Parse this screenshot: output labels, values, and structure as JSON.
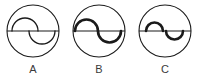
{
  "diagram": {
    "background_color": "#ffffff",
    "stroke_color": "#1a1a1a",
    "label_color": "#3b3b3b",
    "figures": [
      {
        "label": "A",
        "label_name": "figure-label-a",
        "outer_circle": {
          "cx": 33,
          "cy": 30,
          "r": 26,
          "stroke_width": 1.1
        },
        "diameter_line": {
          "x1": 7,
          "y1": 30,
          "x2": 59,
          "y2": 30,
          "stroke_width": 1.1
        },
        "curve_style": "thin",
        "curve_stroke_width": 1.2,
        "arcs": [
          {
            "name": "left-arc-up",
            "cx": 25,
            "cy": 30,
            "r": 13,
            "bulge": "up"
          },
          {
            "name": "right-arc-down",
            "cx": 42,
            "cy": 30,
            "r": 13,
            "bulge": "down"
          }
        ]
      },
      {
        "label": "B",
        "label_name": "figure-label-b",
        "outer_circle": {
          "cx": 33,
          "cy": 30,
          "r": 26,
          "stroke_width": 1.1
        },
        "diameter_line": {
          "x1": 7,
          "y1": 30,
          "x2": 59,
          "y2": 30,
          "stroke_width": 1.1
        },
        "curve_style": "bold",
        "curve_stroke_width": 2.6,
        "arcs": [
          {
            "name": "left-arc-up",
            "cx": 20,
            "cy": 30,
            "r": 11,
            "bulge": "up"
          },
          {
            "name": "right-arc-down",
            "cx": 42,
            "cy": 30,
            "r": 11,
            "bulge": "down"
          }
        ]
      },
      {
        "label": "C",
        "label_name": "figure-label-c",
        "outer_circle": {
          "cx": 33,
          "cy": 30,
          "r": 26,
          "stroke_width": 1.1
        },
        "diameter_line": {
          "x1": 7,
          "y1": 30,
          "x2": 59,
          "y2": 30,
          "stroke_width": 1.1
        },
        "curve_style": "bold-small",
        "curve_stroke_width": 2.6,
        "arcs": [
          {
            "name": "left-arc-up",
            "cx": 22,
            "cy": 30,
            "r": 8,
            "bulge": "up"
          },
          {
            "name": "right-arc-down",
            "cx": 42,
            "cy": 30,
            "r": 8,
            "bulge": "down"
          }
        ]
      }
    ]
  }
}
